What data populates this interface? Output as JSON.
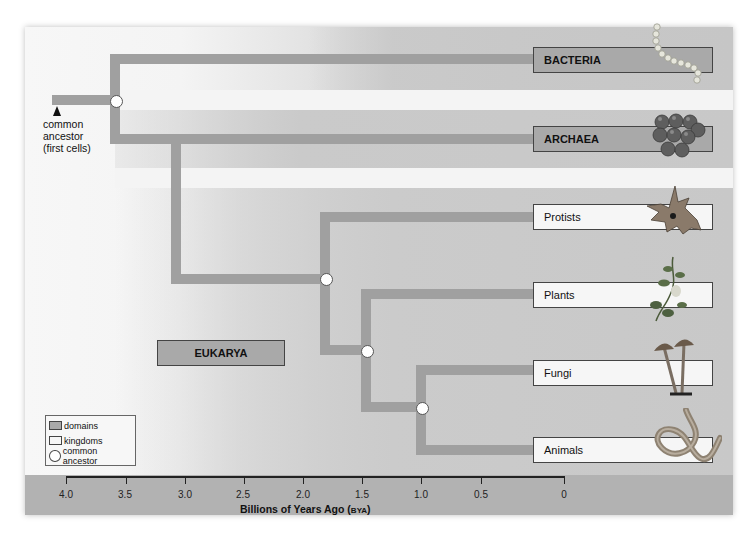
{
  "diagram": {
    "type": "phylogenetic-tree",
    "root": {
      "label": "common ancestor (first cells)",
      "label_lines": [
        "common",
        "ancestor",
        "(first cells)"
      ]
    },
    "domains": [
      {
        "label": "BACTERIA",
        "organism": "bacteria-chain-icon"
      },
      {
        "label": "ARCHAEA",
        "organism": "archaea-cluster-icon"
      },
      {
        "label": "EUKARYA"
      }
    ],
    "kingdoms": [
      {
        "label": "Protists",
        "organism": "protist-icon"
      },
      {
        "label": "Plants",
        "organism": "plant-icon"
      },
      {
        "label": "Fungi",
        "organism": "mushroom-icon"
      },
      {
        "label": "Animals",
        "organism": "worm-icon"
      }
    ],
    "branch_points_bya": {
      "root": 3.6,
      "bacteria_archaea_split": 3.6,
      "archaea_eukarya_split": 3.15,
      "eukarya_protists": 1.8,
      "plants_split": 1.5,
      "fungi_animals_split": 1.0
    },
    "legend": {
      "items": [
        {
          "label": "domains",
          "swatch": "domain"
        },
        {
          "label": "kingdoms",
          "swatch": "kingdom"
        },
        {
          "label": "common ancestor",
          "swatch": "node"
        }
      ]
    },
    "axis": {
      "ticks": [
        "4.0",
        "3.5",
        "3.0",
        "2.5",
        "2.0",
        "1.5",
        "1.0",
        "0.5",
        "0"
      ],
      "title_main": "Billions of Years Ago (",
      "title_abbrev": "BYA",
      "title_end": ")"
    },
    "colors": {
      "branch": "#a0a0a0",
      "domain_box": "#a9a9a9",
      "kingdom_box": "#f6f6f6",
      "band": "#c8c8c8",
      "axis_band": "#b2b2b2"
    }
  }
}
